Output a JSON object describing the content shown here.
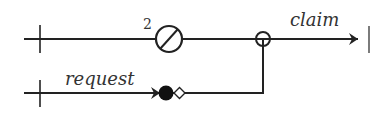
{
  "diagram": {
    "colors": {
      "stroke": "#222222",
      "text": "#333333",
      "background": "#ffffff"
    },
    "top_line": {
      "label": "claim",
      "marker_count": "2",
      "marker": "slashed-circle",
      "junction": "open-circle"
    },
    "bottom_line": {
      "label": "request",
      "markers": [
        "arrowhead",
        "filled-circle",
        "open-diamond"
      ]
    }
  }
}
